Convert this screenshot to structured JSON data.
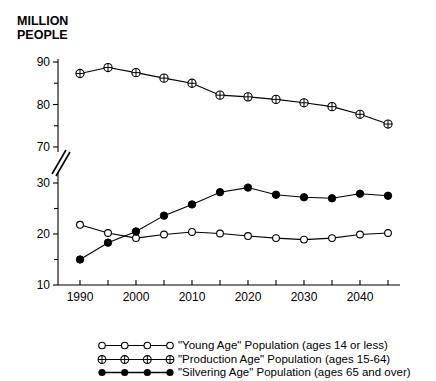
{
  "figure": {
    "cropped_title": "",
    "y_axis_caption": "MILLION\nPEOPLE"
  },
  "chart_data": {
    "type": "line",
    "title": "",
    "xlabel": "",
    "ylabel": "MILLION PEOPLE",
    "grid": false,
    "legend_position": "bottom",
    "broken_axis": true,
    "y_axis": {
      "upper_range": [
        70,
        90
      ],
      "lower_range": [
        10,
        30
      ],
      "major_ticks_upper": [
        70,
        80,
        90
      ],
      "major_ticks_lower": [
        10,
        20,
        30
      ],
      "minor_ticks_upper": [
        75,
        85
      ],
      "minor_ticks_lower": [
        15,
        25
      ],
      "tick_labels": [
        "90",
        "80",
        "70",
        "30",
        "20",
        "10"
      ],
      "break_between": [
        30,
        70
      ]
    },
    "x_axis": {
      "range": [
        1987.5,
        2047.5
      ],
      "major_tick_labels": [
        "1990",
        "2000",
        "2010",
        "2020",
        "2030",
        "2040"
      ],
      "major_tick_values": [
        1990,
        2000,
        2010,
        2020,
        2030,
        2040
      ],
      "minor_tick_values": [
        1995,
        2005,
        2015,
        2025,
        2035,
        2045
      ]
    },
    "x": [
      1990,
      1995,
      2000,
      2005,
      2010,
      2015,
      2020,
      2025,
      2030,
      2035,
      2040,
      2045
    ],
    "series": [
      {
        "name": "\"Young Age\" Population (ages 14 or less)",
        "marker": "open-circle",
        "values": [
          21.8,
          20.2,
          19.2,
          19.9,
          20.4,
          20.1,
          19.6,
          19.2,
          18.9,
          19.2,
          19.9,
          20.2
        ]
      },
      {
        "name": "\"Production Age\" Population (ages 15-64)",
        "marker": "circle-plus",
        "values": [
          87.3,
          88.7,
          87.5,
          86.2,
          85.0,
          82.2,
          81.8,
          81.2,
          80.4,
          79.5,
          77.7,
          75.4
        ]
      },
      {
        "name": "\"Silvering Age\" Population (ages 65 and over)",
        "marker": "filled-circle",
        "values": [
          15.0,
          18.3,
          20.5,
          23.6,
          25.8,
          28.2,
          29.1,
          27.7,
          27.2,
          27.0,
          27.9,
          27.5
        ]
      }
    ]
  },
  "legend": {
    "items": [
      {
        "marker": "open-circle",
        "label": "\"Young Age\" Population (ages 14 or less)"
      },
      {
        "marker": "circle-plus",
        "label": "\"Production Age\" Population (ages 15-64)"
      },
      {
        "marker": "filled-circle",
        "label": "\"Silvering Age\" Population (ages 65 and over)"
      }
    ]
  }
}
